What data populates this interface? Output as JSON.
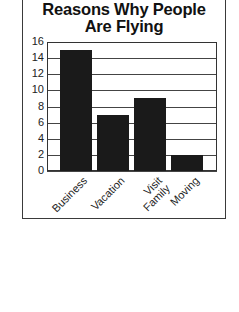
{
  "chart_data": {
    "type": "bar",
    "title": "Reasons Why People Are Flying",
    "title_lines": [
      "Reasons Why People",
      "Are Flying"
    ],
    "categories": [
      "Business",
      "Vacation",
      "Visit Family",
      "Moving"
    ],
    "category_lines": [
      [
        "Business"
      ],
      [
        "Vacation"
      ],
      [
        "Visit",
        "Family"
      ],
      [
        "Moving"
      ]
    ],
    "values": [
      15,
      7,
      9,
      2
    ],
    "xlabel": "",
    "ylabel": "",
    "ylim": [
      0,
      16
    ],
    "yticks": [
      "0",
      "2",
      "4",
      "6",
      "8",
      "10",
      "12",
      "14",
      "16"
    ],
    "grid": true,
    "legend": null,
    "bar_color": "#1a1a1a"
  }
}
